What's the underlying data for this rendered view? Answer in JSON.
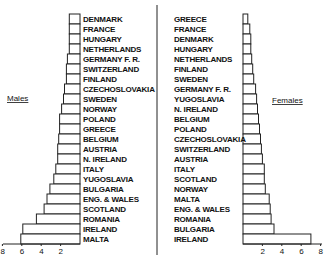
{
  "chart_data": [
    {
      "type": "bar",
      "orientation": "horizontal",
      "title": "Males",
      "direction": "leftward",
      "categories": [
        "DENMARK",
        "FRANCE",
        "HUNGARY",
        "NETHERLANDS",
        "GERMANY F. R.",
        "SWITZERLAND",
        "FINLAND",
        "CZECHOSLOVAKIA",
        "SWEDEN",
        "NORWAY",
        "POLAND",
        "GREECE",
        "BELGIUM",
        "AUSTRIA",
        "N. IRELAND",
        "ITALY",
        "YUGOSLAVIA",
        "BULGARIA",
        "ENG. & WALES",
        "SCOTLAND",
        "ROMANIA",
        "IRELAND",
        "MALTA"
      ],
      "values": [
        1.1,
        1.1,
        1.1,
        1.1,
        1.3,
        1.4,
        1.4,
        1.6,
        1.7,
        1.9,
        2.1,
        2.1,
        2.2,
        2.3,
        2.3,
        2.5,
        2.7,
        3.1,
        3.4,
        3.7,
        4.5,
        5.9,
        6.1
      ],
      "xticks": [
        "8",
        "6",
        "4",
        "2"
      ],
      "xlim": [
        0,
        8
      ],
      "xlabel": "",
      "grid": false
    },
    {
      "type": "bar",
      "orientation": "horizontal",
      "title": "Females",
      "direction": "rightward",
      "categories": [
        "GREECE",
        "FRANCE",
        "DENMARK",
        "HUNGARY",
        "NETHERLANDS",
        "FINLAND",
        "SWEDEN",
        "GERMANY F. R.",
        "YUGOSLAVIA",
        "N. IRELAND",
        "BELGIUM",
        "POLAND",
        "CZECHOSLOVAKIA",
        "SWITZERLAND",
        "AUSTRIA",
        "ITALY",
        "SCOTLAND",
        "NORWAY",
        "MALTA",
        "ENG. & WALES",
        "ROMANIA",
        "BULGARIA",
        "IRELAND"
      ],
      "values": [
        0.5,
        0.7,
        0.8,
        0.8,
        0.9,
        1.0,
        1.1,
        1.3,
        1.4,
        1.5,
        1.6,
        1.7,
        1.8,
        1.9,
        2.0,
        2.2,
        2.2,
        2.3,
        2.7,
        2.8,
        2.9,
        3.2,
        7.0
      ],
      "xticks": [
        "2",
        "4",
        "6",
        "8"
      ],
      "xlim": [
        0,
        8
      ],
      "xlabel": "",
      "grid": false
    }
  ],
  "labels": {
    "males": "Males",
    "females": "Females"
  },
  "colors": {
    "bar_fill": "#ffffff",
    "bar_stroke": "#222222",
    "text": "#111111"
  }
}
